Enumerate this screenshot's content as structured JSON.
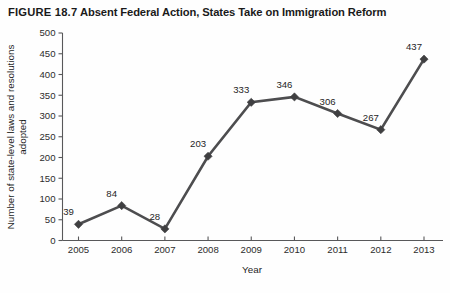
{
  "figure": {
    "number_label": "FIGURE 18.7",
    "title": "Absent Federal Action, States Take on Immigration Reform"
  },
  "colors": {
    "line": "#4d4d4f",
    "marker": "#3f3f41",
    "axis": "#58585a",
    "text": "#1f1f1f",
    "background": "#fefefe"
  },
  "chart_data": {
    "type": "line",
    "title": "Absent Federal Action, States Take on Immigration Reform",
    "xlabel": "Year",
    "ylabel": "Number of state-level laws and resolutions adopted",
    "ylabel_lines": [
      "Number of state-level laws and resolutions",
      "adopted"
    ],
    "categories": [
      "2005",
      "2006",
      "2007",
      "2008",
      "2009",
      "2010",
      "2011",
      "2012",
      "2013"
    ],
    "values": [
      39,
      84,
      28,
      203,
      333,
      346,
      306,
      267,
      437
    ],
    "point_labels": [
      "39",
      "84",
      "28",
      "203",
      "333",
      "346",
      "306",
      "267",
      "437"
    ],
    "ylim": [
      0,
      500
    ],
    "ytick_step": 50,
    "ytick_labels": [
      "0",
      "50",
      "100",
      "150",
      "200",
      "250",
      "300",
      "350",
      "400",
      "450",
      "500"
    ],
    "xtick_labels": [
      "2005",
      "2006",
      "2007",
      "2008",
      "2009",
      "2010",
      "2011",
      "2012",
      "2013"
    ],
    "grid": false,
    "legend": false,
    "marker_shape": "diamond"
  }
}
